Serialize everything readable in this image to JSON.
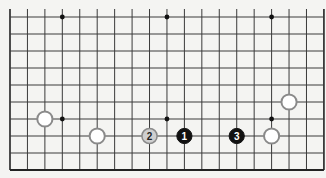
{
  "diagram": {
    "type": "go-board-partial",
    "board_size": 19,
    "visible_region": "bottom edge, full width, 10 rows",
    "grid": {
      "origin_x": 10,
      "origin_y": 17,
      "step_x": 17.44,
      "step_y": 17,
      "cols": 19,
      "rows": 10,
      "top_overhang": 8,
      "line_color": "#3a3a3a",
      "edge_color": "#222222"
    },
    "hoshi": [
      {
        "col": 3,
        "row": 0
      },
      {
        "col": 9,
        "row": 0
      },
      {
        "col": 15,
        "row": 0
      },
      {
        "col": 3,
        "row": 6
      },
      {
        "col": 9,
        "row": 6
      },
      {
        "col": 15,
        "row": 6
      }
    ],
    "stones": [
      {
        "color": "white",
        "col": 2,
        "row": 6,
        "label": ""
      },
      {
        "color": "white",
        "col": 5,
        "row": 7,
        "label": ""
      },
      {
        "color": "grey",
        "col": 8,
        "row": 7,
        "label": "2"
      },
      {
        "color": "black",
        "col": 10,
        "row": 7,
        "label": "1"
      },
      {
        "color": "black",
        "col": 13,
        "row": 7,
        "label": "3"
      },
      {
        "color": "white",
        "col": 15,
        "row": 7,
        "label": ""
      },
      {
        "color": "white",
        "col": 16,
        "row": 5,
        "label": ""
      }
    ],
    "colors": {
      "background": "#f4f4f2",
      "black_stone": "#111111",
      "white_stone_fill": "#ffffff",
      "white_stone_stroke": "#8a8a8a",
      "grey_stone_fill": "#cfcfcf",
      "grey_stone_stroke": "#8a8a8a",
      "label_on_black": "#ffffff",
      "label_on_grey": "#222222"
    }
  }
}
